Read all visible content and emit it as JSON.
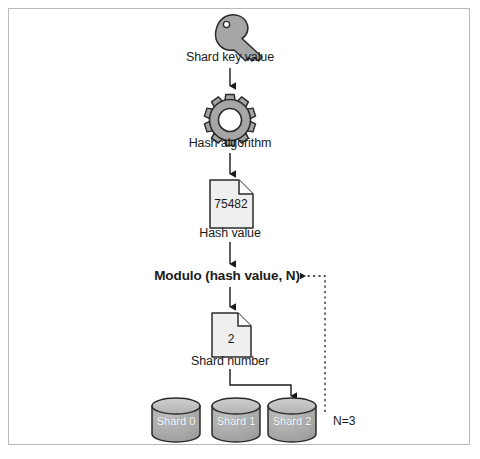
{
  "figure": {
    "border_color": "#b9b9b9",
    "background": "#ffffff"
  },
  "palette": {
    "icon_fill": "#a6a6a6",
    "icon_stroke": "#2b2b2b",
    "doc_fill": "#efefef",
    "doc_stroke": "#2b2b2b",
    "shard_fill": "#a8a8a8",
    "shard_top": "#bdbdbd",
    "shard_stroke": "#2b2b2b",
    "connector": "#1a1a1a",
    "text": "#1a1a1a",
    "shard_text": "#ffffff"
  },
  "nodes": {
    "key": {
      "icon": "key-icon",
      "label": "Shard key value"
    },
    "gear": {
      "icon": "gear-icon",
      "label": "Hash algorithm"
    },
    "hash_value": {
      "icon": "document-icon",
      "value": "75482",
      "label": "Hash value"
    },
    "modulo": {
      "label": "Modulo (hash value, N)"
    },
    "shard_number": {
      "icon": "document-icon",
      "value": "2",
      "label": "Shard number"
    }
  },
  "shards": [
    {
      "label": "Shard 0",
      "icon": "database-cylinder-icon"
    },
    {
      "label": "Shard 1",
      "icon": "database-cylinder-icon"
    },
    {
      "label": "Shard 2",
      "icon": "database-cylinder-icon"
    }
  ],
  "annotations": {
    "n_value": "N=3"
  }
}
